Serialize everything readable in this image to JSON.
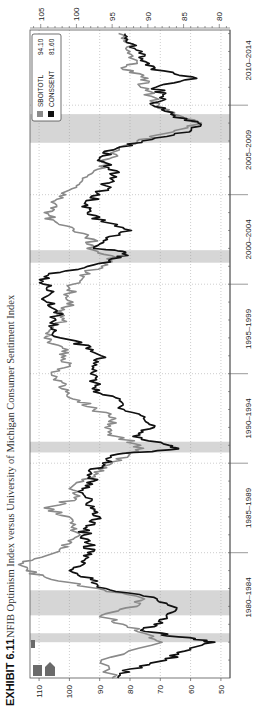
{
  "exhibit": {
    "label": "EXHIBIT 6.11",
    "title": "NFIB Optimism Index versus University of Michigan Consumer Sentiment Index"
  },
  "colors": {
    "sboitotl": "#8a8a8a",
    "conssent": "#111111",
    "recession": "#d6d6d6",
    "grid": "#9a9a9a",
    "axis": "#555555"
  },
  "chart_data": {
    "type": "line",
    "title": "NFIB Optimism Index versus University of Michigan Consumer Sentiment Index",
    "orientation": "rotated-90-ccw",
    "xlabel": "",
    "x_tick_labels": [
      "1980–1984",
      "1985–1989",
      "1990–1994",
      "1995–1999",
      "2000–2004",
      "2005–2009",
      "2010–2014"
    ],
    "x_range": [
      1978.0,
      2014.2
    ],
    "y_left": {
      "series": "CONSSENT",
      "ticks": [
        50,
        60,
        70,
        80,
        90,
        100,
        110
      ],
      "range": [
        47,
        113
      ]
    },
    "y_right": {
      "series": "SBOITOTL",
      "ticks": [
        80,
        85,
        90,
        95,
        100,
        105
      ],
      "range": [
        78.5,
        106.5
      ]
    },
    "grid": true,
    "legend": {
      "placement": "top-right",
      "entries": [
        {
          "name": "SBOITOTL",
          "last_value": "94.10"
        },
        {
          "name": "CONSSENT",
          "last_value": "81.60"
        }
      ]
    },
    "recessions": [
      [
        1980.0,
        1980.5
      ],
      [
        1981.5,
        1982.9
      ],
      [
        1990.6,
        1991.2
      ],
      [
        2001.2,
        2001.9
      ],
      [
        2007.9,
        2009.5
      ]
    ],
    "series": [
      {
        "name": "SBOITOTL",
        "axis": "right",
        "x": [
          1978.0,
          1979.0,
          1980.0,
          1980.5,
          1981.0,
          1981.5,
          1982.0,
          1982.5,
          1983.0,
          1983.5,
          1984.0,
          1984.5,
          1985.0,
          1985.5,
          1986.0,
          1986.5,
          1987.0,
          1987.5,
          1988.0,
          1988.5,
          1989.0,
          1989.5,
          1990.0,
          1990.5,
          1991.0,
          1991.5,
          1992.0,
          1992.5,
          1993.0,
          1993.5,
          1994.0,
          1994.5,
          1995.0,
          1995.5,
          1996.0,
          1996.5,
          1997.0,
          1997.5,
          1998.0,
          1998.5,
          1999.0,
          1999.5,
          2000.0,
          2000.5,
          2001.0,
          2001.5,
          2002.0,
          2002.5,
          2003.0,
          2003.5,
          2004.0,
          2004.5,
          2005.0,
          2005.5,
          2006.0,
          2006.5,
          2007.0,
          2007.5,
          2008.0,
          2008.5,
          2009.0,
          2009.5,
          2010.0,
          2010.5,
          2011.0,
          2011.5,
          2012.0,
          2012.5,
          2013.0,
          2013.5,
          2014.0
        ],
        "values": [
          95.0,
          96.5,
          88.0,
          90.5,
          93.5,
          96.5,
          91.5,
          91.0,
          97.0,
          103.5,
          107.0,
          107.5,
          103.0,
          101.0,
          99.5,
          100.5,
          101.0,
          104.5,
          100.0,
          100.5,
          99.0,
          97.5,
          95.0,
          92.5,
          91.0,
          94.5,
          96.0,
          94.5,
          97.5,
          99.5,
          101.5,
          102.0,
          103.5,
          101.0,
          101.5,
          102.0,
          104.5,
          103.5,
          102.0,
          102.5,
          100.5,
          101.0,
          100.5,
          99.5,
          96.5,
          94.5,
          98.5,
          97.5,
          100.5,
          103.0,
          104.5,
          103.0,
          101.5,
          100.0,
          98.5,
          96.0,
          95.5,
          94.0,
          91.5,
          86.5,
          82.5,
          86.5,
          88.5,
          89.5,
          91.0,
          90.0,
          93.5,
          91.5,
          92.5,
          93.0,
          94.1
        ]
      },
      {
        "name": "CONSSENT",
        "axis": "left",
        "x": [
          1978.0,
          1978.5,
          1979.0,
          1979.5,
          1980.0,
          1980.3,
          1980.6,
          1981.0,
          1981.5,
          1982.0,
          1982.5,
          1983.0,
          1983.5,
          1984.0,
          1984.5,
          1985.0,
          1985.5,
          1986.0,
          1986.5,
          1987.0,
          1987.5,
          1988.0,
          1988.5,
          1989.0,
          1989.5,
          1990.0,
          1990.5,
          1990.8,
          1991.0,
          1991.5,
          1992.0,
          1992.5,
          1993.0,
          1993.5,
          1994.0,
          1994.5,
          1995.0,
          1995.5,
          1996.0,
          1996.5,
          1997.0,
          1997.5,
          1998.0,
          1998.5,
          1999.0,
          1999.5,
          2000.0,
          2000.5,
          2001.0,
          2001.5,
          2001.8,
          2002.0,
          2002.5,
          2003.0,
          2003.5,
          2004.0,
          2004.5,
          2005.0,
          2005.5,
          2006.0,
          2006.5,
          2007.0,
          2007.5,
          2008.0,
          2008.5,
          2009.0,
          2009.5,
          2010.0,
          2010.5,
          2011.0,
          2011.5,
          2012.0,
          2012.5,
          2013.0,
          2013.5,
          2014.0
        ],
        "values": [
          84.0,
          80.0,
          68.0,
          62.0,
          52.0,
          64.0,
          75.0,
          72.0,
          68.0,
          66.0,
          72.0,
          88.0,
          93.0,
          100.0,
          96.0,
          94.0,
          93.5,
          95.0,
          94.5,
          90.0,
          93.0,
          92.5,
          95.5,
          92.0,
          93.0,
          89.0,
          84.0,
          64.0,
          67.0,
          79.0,
          72.0,
          75.5,
          82.0,
          83.5,
          92.0,
          91.5,
          93.0,
          91.0,
          89.5,
          93.0,
          103.0,
          106.0,
          104.5,
          104.0,
          107.5,
          106.0,
          108.5,
          107.0,
          94.0,
          83.0,
          81.5,
          92.0,
          87.5,
          79.5,
          89.5,
          94.0,
          95.0,
          90.0,
          88.0,
          84.5,
          87.0,
          90.0,
          85.5,
          76.0,
          60.5,
          57.5,
          66.5,
          72.5,
          69.0,
          71.5,
          58.0,
          73.0,
          76.5,
          76.0,
          81.0,
          81.6
        ]
      }
    ]
  }
}
